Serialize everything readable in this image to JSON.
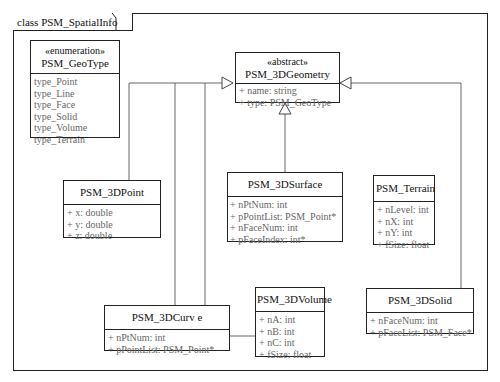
{
  "frame": {
    "title": "class PSM_SpatialInfo"
  },
  "classes": {
    "geotype": {
      "stereotype": "«enumeration»",
      "name": "PSM_GeoType",
      "attrs": [
        "type_Point",
        "type_Line",
        "type_Face",
        "type_Solid",
        "type_Volume",
        "type_Terrain"
      ]
    },
    "geometry": {
      "stereotype": "«abstract»",
      "name": "PSM_3DGeometry",
      "attrs": [
        "+ name: string",
        "+ type: PSM_GeoType"
      ]
    },
    "point": {
      "name": "PSM_3DPoint",
      "attrs": [
        "+ x: double",
        "+ y: double",
        "+ z: double"
      ]
    },
    "surface": {
      "name": "PSM_3DSurface",
      "attrs": [
        "+ nPtNum: int",
        "+ pPointList: PSM_Point*",
        "+ nFaceNum: int",
        "+ pFaceIndex: int*"
      ]
    },
    "terrain": {
      "name": "PSM_Terrain",
      "attrs": [
        "+ nLevel: int",
        "+ nX: int",
        "+ nY: int",
        "+ fSize: float"
      ]
    },
    "curve": {
      "name": "PSM_3DCurv e",
      "attrs": [
        "+ nPtNum: int",
        "+ pPointList: PSM_Point*"
      ]
    },
    "volume": {
      "name": "PSM_3DVolume",
      "attrs": [
        "+ nA: int",
        "+ nB: int",
        "+ nC: int",
        "+ fSize: float"
      ]
    },
    "solid": {
      "name": "PSM_3DSolid",
      "attrs": [
        "+ nFaceNum: int",
        "+ pFaceList: PSM_Face*"
      ]
    }
  },
  "relations": [
    {
      "type": "generalization",
      "from": "PSM_3DPoint",
      "to": "PSM_3DGeometry"
    },
    {
      "type": "generalization",
      "from": "PSM_3DCurv e",
      "to": "PSM_3DGeometry"
    },
    {
      "type": "generalization",
      "from": "PSM_3DVolume",
      "to": "PSM_3DGeometry"
    },
    {
      "type": "generalization",
      "from": "PSM_3DSurface",
      "to": "PSM_3DGeometry"
    },
    {
      "type": "generalization",
      "from": "PSM_3DSolid",
      "to": "PSM_3DGeometry"
    }
  ]
}
